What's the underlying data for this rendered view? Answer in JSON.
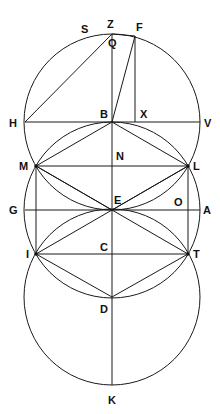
{
  "diagram": {
    "type": "geometric-construction",
    "stroke_color": "#1a1a1a",
    "background": "#ffffff",
    "points": {
      "Z": [
        112,
        34
      ],
      "F": [
        135,
        36
      ],
      "S": [
        93,
        36
      ],
      "Q": [
        112,
        36
      ],
      "H": [
        25,
        122
      ],
      "B": [
        112,
        122
      ],
      "X": [
        135,
        122
      ],
      "V": [
        200,
        122
      ],
      "M": [
        36,
        166
      ],
      "N": [
        112,
        166
      ],
      "L": [
        188,
        166
      ],
      "G": [
        25,
        210
      ],
      "E": [
        112,
        210
      ],
      "O": [
        188,
        210
      ],
      "A": [
        200,
        210
      ],
      "I": [
        36,
        254
      ],
      "C": [
        112,
        254
      ],
      "T": [
        188,
        254
      ],
      "D": [
        112,
        297
      ],
      "K": [
        112,
        385
      ]
    },
    "circles": [
      {
        "name": "circle-center-B",
        "center": "B",
        "r": 88
      },
      {
        "name": "circle-center-E",
        "center": "E",
        "r": 88
      },
      {
        "name": "circle-center-D",
        "center": "D",
        "r": 88
      }
    ],
    "segments": [
      [
        "Z",
        "K"
      ],
      [
        "H",
        "V"
      ],
      [
        "G",
        "A"
      ],
      [
        "M",
        "L"
      ],
      [
        "I",
        "T"
      ],
      [
        "M",
        "I"
      ],
      [
        "L",
        "T"
      ],
      [
        "H",
        "Z"
      ],
      [
        "B",
        "F"
      ],
      [
        "F",
        "X"
      ],
      [
        "Z",
        "F"
      ],
      [
        "B",
        "M"
      ],
      [
        "B",
        "L"
      ],
      [
        "M",
        "E"
      ],
      [
        "L",
        "E"
      ],
      [
        "I",
        "D"
      ],
      [
        "T",
        "D"
      ],
      [
        "M",
        "T"
      ],
      [
        "L",
        "I"
      ]
    ],
    "labels": [
      {
        "text": "S",
        "x": 81,
        "y": 33
      },
      {
        "text": "Z",
        "x": 107,
        "y": 28
      },
      {
        "text": "F",
        "x": 136,
        "y": 31
      },
      {
        "text": "Q",
        "x": 108,
        "y": 47
      },
      {
        "text": "H",
        "x": 9,
        "y": 127
      },
      {
        "text": "B",
        "x": 100,
        "y": 118
      },
      {
        "text": "X",
        "x": 140,
        "y": 118
      },
      {
        "text": "V",
        "x": 204,
        "y": 127
      },
      {
        "text": "M",
        "x": 19,
        "y": 170
      },
      {
        "text": "N",
        "x": 116,
        "y": 160
      },
      {
        "text": "L",
        "x": 193,
        "y": 170
      },
      {
        "text": "G",
        "x": 9,
        "y": 214
      },
      {
        "text": "E",
        "x": 114,
        "y": 204
      },
      {
        "text": "O",
        "x": 174,
        "y": 206
      },
      {
        "text": "A",
        "x": 203,
        "y": 214
      },
      {
        "text": "I",
        "x": 26,
        "y": 258
      },
      {
        "text": "C",
        "x": 100,
        "y": 251
      },
      {
        "text": "T",
        "x": 193,
        "y": 258
      },
      {
        "text": "D",
        "x": 100,
        "y": 313
      },
      {
        "text": "K",
        "x": 108,
        "y": 404
      }
    ]
  }
}
